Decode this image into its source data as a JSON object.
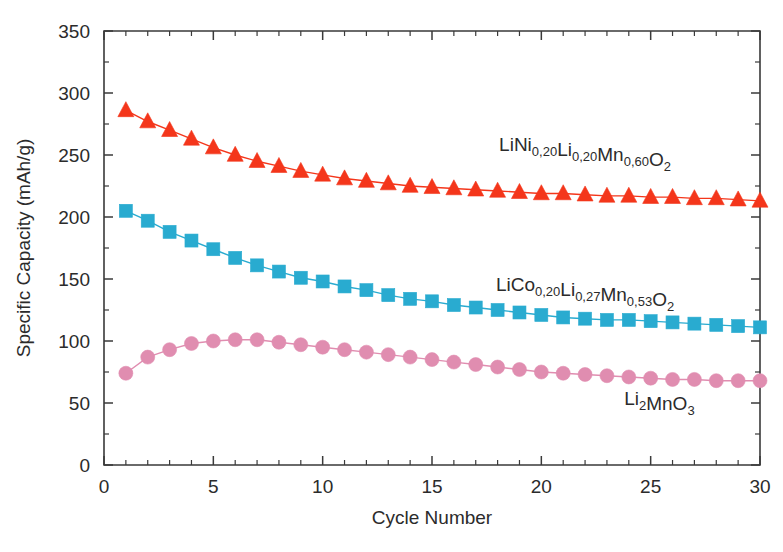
{
  "chart_data": {
    "type": "line",
    "title": "",
    "xlabel": "Cycle Number",
    "ylabel": "Specific Capacity (mAh/g)",
    "xlim": [
      0,
      30
    ],
    "ylim": [
      0,
      350
    ],
    "x_major_ticks": [
      0,
      5,
      10,
      15,
      20,
      25,
      30
    ],
    "x_tick_labels": [
      "0",
      "5",
      "10",
      "15",
      "20",
      "25",
      "30"
    ],
    "x_minor_step": 1,
    "y_major_ticks": [
      0,
      50,
      100,
      150,
      200,
      250,
      300,
      350
    ],
    "y_tick_labels": [
      "0",
      "50",
      "100",
      "150",
      "200",
      "250",
      "300",
      "350"
    ],
    "y_minor_step": 25,
    "grid": false,
    "legend": "inline-annotations",
    "x": [
      1,
      2,
      3,
      4,
      5,
      6,
      7,
      8,
      9,
      10,
      11,
      12,
      13,
      14,
      15,
      16,
      17,
      18,
      19,
      20,
      21,
      22,
      23,
      24,
      25,
      26,
      27,
      28,
      29,
      30
    ],
    "series": [
      {
        "name": "LiNi0.20Li0.20Mn0.60O2",
        "label_parts": [
          {
            "t": "LiNi",
            "sub": false
          },
          {
            "t": "0,20",
            "sub": true
          },
          {
            "t": "Li",
            "sub": false
          },
          {
            "t": "0,20",
            "sub": true
          },
          {
            "t": "Mn",
            "sub": false
          },
          {
            "t": "0,60",
            "sub": true
          },
          {
            "t": "O",
            "sub": false
          },
          {
            "t": "2",
            "sub": true
          }
        ],
        "marker": "triangle",
        "color": "#F4361B",
        "values": [
          286,
          277,
          270,
          263,
          256,
          250,
          245,
          241,
          237,
          234,
          231,
          229,
          227,
          225,
          224,
          223,
          222,
          221,
          220,
          219,
          219,
          218,
          217,
          217,
          216,
          216,
          215,
          215,
          214,
          213
        ],
        "annotation_x": 22.0,
        "annotation_y": 253
      },
      {
        "name": "LiCo0.20Li0.27Mn0.53O2",
        "label_parts": [
          {
            "t": "LiCo",
            "sub": false
          },
          {
            "t": "0,20",
            "sub": true
          },
          {
            "t": "Li",
            "sub": false
          },
          {
            "t": "0,27",
            "sub": true
          },
          {
            "t": "Mn",
            "sub": false
          },
          {
            "t": "0,53",
            "sub": true
          },
          {
            "t": "O",
            "sub": false
          },
          {
            "t": "2",
            "sub": true
          }
        ],
        "marker": "square",
        "color": "#29ABD0",
        "values": [
          205,
          197,
          188,
          181,
          174,
          167,
          161,
          156,
          151,
          148,
          144,
          141,
          137,
          134,
          132,
          129,
          127,
          125,
          123,
          121,
          119,
          118,
          117,
          117,
          116,
          115,
          114,
          113,
          112,
          111
        ],
        "annotation_x": 22.0,
        "annotation_y": 140
      },
      {
        "name": "Li2MnO3",
        "label_parts": [
          {
            "t": "Li",
            "sub": false
          },
          {
            "t": "2",
            "sub": true
          },
          {
            "t": "MnO",
            "sub": false
          },
          {
            "t": "3",
            "sub": true
          }
        ],
        "marker": "circle",
        "color": "#E08DB0",
        "values": [
          74,
          87,
          93,
          98,
          100,
          101,
          101,
          99,
          97,
          95,
          93,
          91,
          89,
          87,
          85,
          83,
          81,
          79,
          77,
          75,
          74,
          73,
          72,
          71,
          70,
          69,
          69,
          68,
          68,
          68
        ],
        "annotation_x": 25.4,
        "annotation_y": 48
      }
    ]
  },
  "axis": {
    "x_title": "Cycle Number",
    "y_title": "Specific Capacity (mAh/g)"
  },
  "colors": {
    "series_red": "#F4361B",
    "series_cyan": "#29ABD0",
    "series_pink": "#E08DB0",
    "axis": "#3a3a3a",
    "text": "#2b2b2b",
    "background": "#ffffff"
  }
}
